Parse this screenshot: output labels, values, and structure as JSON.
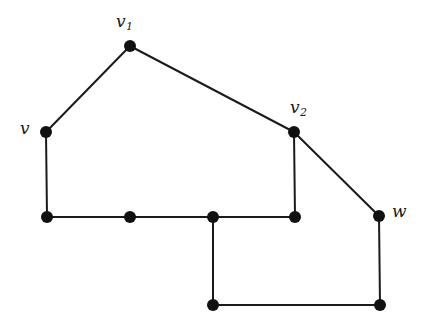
{
  "figure": {
    "background_color": "#ffffff",
    "line_color": "#1a1a1a",
    "node_color": "#111111",
    "node_radius": 6,
    "edge_width": 2,
    "width": 427,
    "height": 327
  },
  "nodes": [
    {
      "id": "v1",
      "label": "v",
      "subscript": "1",
      "x": 130,
      "y": 46,
      "labeled": true,
      "label_x": 116,
      "label_y": 13
    },
    {
      "id": "v",
      "label": "v",
      "subscript": "",
      "x": 46,
      "y": 132,
      "labeled": true,
      "label_x": 20,
      "label_y": 120
    },
    {
      "id": "v2",
      "label": "v",
      "subscript": "2",
      "x": 294,
      "y": 132,
      "labeled": true,
      "label_x": 290,
      "label_y": 99
    },
    {
      "id": "w",
      "label": "w",
      "subscript": "",
      "x": 379,
      "y": 216,
      "labeled": true,
      "label_x": 392,
      "label_y": 203
    },
    {
      "id": "a",
      "label": "",
      "subscript": "",
      "x": 47,
      "y": 217,
      "labeled": false,
      "label_x": 0,
      "label_y": 0
    },
    {
      "id": "b",
      "label": "",
      "subscript": "",
      "x": 130,
      "y": 217,
      "labeled": false,
      "label_x": 0,
      "label_y": 0
    },
    {
      "id": "c",
      "label": "",
      "subscript": "",
      "x": 213,
      "y": 217,
      "labeled": false,
      "label_x": 0,
      "label_y": 0
    },
    {
      "id": "d",
      "label": "",
      "subscript": "",
      "x": 295,
      "y": 217,
      "labeled": false,
      "label_x": 0,
      "label_y": 0
    },
    {
      "id": "e",
      "label": "",
      "subscript": "",
      "x": 213,
      "y": 305,
      "labeled": false,
      "label_x": 0,
      "label_y": 0
    },
    {
      "id": "f",
      "label": "",
      "subscript": "",
      "x": 380,
      "y": 305,
      "labeled": false,
      "label_x": 0,
      "label_y": 0
    }
  ],
  "edges": [
    {
      "from": "v",
      "to": "v1"
    },
    {
      "from": "v1",
      "to": "v2"
    },
    {
      "from": "v2",
      "to": "w"
    },
    {
      "from": "v",
      "to": "a"
    },
    {
      "from": "a",
      "to": "b"
    },
    {
      "from": "b",
      "to": "c"
    },
    {
      "from": "c",
      "to": "d"
    },
    {
      "from": "d",
      "to": "v2"
    },
    {
      "from": "c",
      "to": "e"
    },
    {
      "from": "e",
      "to": "f"
    },
    {
      "from": "f",
      "to": "w"
    }
  ]
}
